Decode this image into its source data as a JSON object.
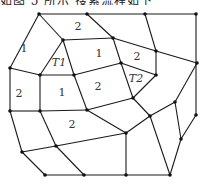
{
  "caption": "如图 5 所示 搜索流程如下",
  "diagram": {
    "nodes": [
      [
        39,
        14
      ],
      [
        87,
        14
      ],
      [
        145,
        14
      ],
      [
        196,
        14
      ],
      [
        63,
        40
      ],
      [
        113,
        38
      ],
      [
        156,
        51
      ],
      [
        197,
        63
      ],
      [
        121,
        63
      ],
      [
        156,
        75
      ],
      [
        10,
        68
      ],
      [
        40,
        75
      ],
      [
        74,
        75
      ],
      [
        133,
        98
      ],
      [
        175,
        102
      ],
      [
        150,
        116
      ],
      [
        196,
        115
      ],
      [
        10,
        111
      ],
      [
        40,
        111
      ],
      [
        87,
        110
      ],
      [
        126,
        133
      ],
      [
        181,
        139
      ],
      [
        22,
        152
      ],
      [
        56,
        146
      ],
      [
        45,
        175
      ],
      [
        84,
        175
      ],
      [
        126,
        175
      ],
      [
        170,
        175
      ]
    ],
    "edges": [
      [
        [
          39,
          14
        ],
        [
          87,
          14
        ]
      ],
      [
        [
          87,
          14
        ],
        [
          145,
          14
        ]
      ],
      [
        [
          145,
          14
        ],
        [
          196,
          14
        ]
      ],
      [
        [
          39,
          14
        ],
        [
          10,
          68
        ]
      ],
      [
        [
          39,
          14
        ],
        [
          63,
          40
        ]
      ],
      [
        [
          87,
          14
        ],
        [
          113,
          38
        ]
      ],
      [
        [
          145,
          14
        ],
        [
          156,
          51
        ]
      ],
      [
        [
          63,
          40
        ],
        [
          113,
          38
        ]
      ],
      [
        [
          63,
          40
        ],
        [
          40,
          75
        ]
      ],
      [
        [
          63,
          40
        ],
        [
          74,
          75
        ]
      ],
      [
        [
          113,
          38
        ],
        [
          121,
          63
        ]
      ],
      [
        [
          113,
          38
        ],
        [
          156,
          51
        ]
      ],
      [
        [
          156,
          51
        ],
        [
          197,
          63
        ]
      ],
      [
        [
          156,
          51
        ],
        [
          156,
          75
        ]
      ],
      [
        [
          121,
          63
        ],
        [
          156,
          75
        ]
      ],
      [
        [
          121,
          63
        ],
        [
          133,
          98
        ]
      ],
      [
        [
          74,
          75
        ],
        [
          121,
          63
        ]
      ],
      [
        [
          156,
          75
        ],
        [
          133,
          98
        ]
      ],
      [
        [
          133,
          98
        ],
        [
          87,
          110
        ]
      ],
      [
        [
          133,
          98
        ],
        [
          150,
          116
        ]
      ],
      [
        [
          10,
          68
        ],
        [
          40,
          75
        ]
      ],
      [
        [
          40,
          75
        ],
        [
          74,
          75
        ]
      ],
      [
        [
          10,
          68
        ],
        [
          10,
          111
        ]
      ],
      [
        [
          40,
          75
        ],
        [
          40,
          111
        ]
      ],
      [
        [
          74,
          75
        ],
        [
          87,
          110
        ]
      ],
      [
        [
          10,
          111
        ],
        [
          40,
          111
        ]
      ],
      [
        [
          40,
          111
        ],
        [
          87,
          110
        ]
      ],
      [
        [
          10,
          111
        ],
        [
          22,
          152
        ]
      ],
      [
        [
          40,
          111
        ],
        [
          56,
          146
        ]
      ],
      [
        [
          87,
          110
        ],
        [
          126,
          133
        ]
      ],
      [
        [
          22,
          152
        ],
        [
          56,
          146
        ]
      ],
      [
        [
          56,
          146
        ],
        [
          126,
          133
        ]
      ],
      [
        [
          22,
          152
        ],
        [
          45,
          175
        ]
      ],
      [
        [
          56,
          146
        ],
        [
          84,
          175
        ]
      ],
      [
        [
          45,
          175
        ],
        [
          84,
          175
        ]
      ],
      [
        [
          84,
          175
        ],
        [
          126,
          175
        ]
      ],
      [
        [
          126,
          175
        ],
        [
          170,
          175
        ]
      ],
      [
        [
          126,
          133
        ],
        [
          126,
          175
        ]
      ],
      [
        [
          126,
          133
        ],
        [
          150,
          116
        ]
      ],
      [
        [
          150,
          116
        ],
        [
          175,
          102
        ]
      ],
      [
        [
          150,
          116
        ],
        [
          170,
          175
        ]
      ],
      [
        [
          175,
          102
        ],
        [
          197,
          63
        ]
      ],
      [
        [
          175,
          102
        ],
        [
          181,
          139
        ]
      ],
      [
        [
          196,
          14
        ],
        [
          196,
          115
        ]
      ],
      [
        [
          196,
          115
        ],
        [
          181,
          139
        ]
      ],
      [
        [
          181,
          139
        ],
        [
          170,
          175
        ]
      ]
    ],
    "labels": [
      {
        "text": "1",
        "x": 24,
        "y": 52,
        "italic": false
      },
      {
        "text": "2",
        "x": 78,
        "y": 30,
        "italic": false
      },
      {
        "text": "1",
        "x": 99,
        "y": 57,
        "italic": false
      },
      {
        "text": "2",
        "x": 137,
        "y": 60,
        "italic": false
      },
      {
        "text": "T1",
        "x": 59,
        "y": 66,
        "italic": true
      },
      {
        "text": "T2",
        "x": 136,
        "y": 82,
        "italic": true
      },
      {
        "text": "2",
        "x": 19,
        "y": 97,
        "italic": false
      },
      {
        "text": "1",
        "x": 62,
        "y": 96,
        "italic": false
      },
      {
        "text": "2",
        "x": 98,
        "y": 90,
        "italic": false
      },
      {
        "text": "2",
        "x": 72,
        "y": 128,
        "italic": false
      }
    ]
  }
}
